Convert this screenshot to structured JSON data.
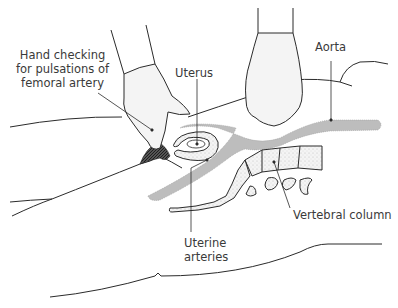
{
  "diagram": {
    "type": "anatomical illustration",
    "colors": {
      "outline": "#2b2b2b",
      "vessel_fill": "#bdbdbd",
      "bone_fill": "#f2f2f2",
      "text": "#3a3a3a"
    },
    "labels": {
      "hand_checking": "Hand checking\nfor pulsations of\nfemoral artery",
      "uterus": "Uterus",
      "aorta": "Aorta",
      "vertebral_column": "Vertebral column",
      "uterine_arteries": "Uterine\narteries"
    }
  }
}
